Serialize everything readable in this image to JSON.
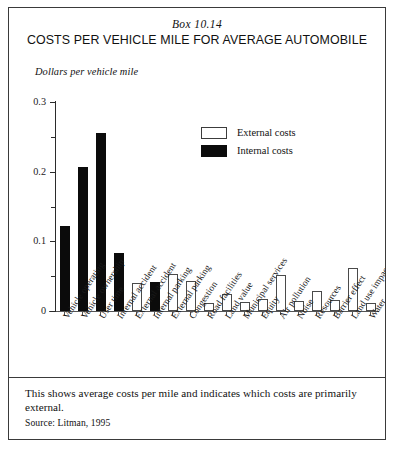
{
  "header": {
    "box_number": "Box 10.14",
    "title": "COSTS PER VEHICLE MILE FOR AVERAGE AUTOMOBILE"
  },
  "legend": {
    "external_label": "External costs",
    "internal_label": "Internal costs",
    "external_color": "#ffffff",
    "internal_color": "#0b0b0b"
  },
  "footer": {
    "note": "This shows average costs per mile and indicates which costs are primarily external.",
    "source": "Source: Litman, 1995"
  },
  "chart_data": {
    "type": "bar",
    "title": "COSTS PER VEHICLE MILE FOR AVERAGE AUTOMOBILE",
    "subtitle": "Box 10.14",
    "xlabel": "",
    "ylabel": "Dollars per vehicle mile",
    "ylim": [
      0,
      0.3
    ],
    "ytick_labels": [
      "0",
      "0.1",
      "0.2",
      "0.3"
    ],
    "ytick_values": [
      0,
      0.1,
      0.2,
      0.3
    ],
    "yminor_values": [
      0.05,
      0.15,
      0.25
    ],
    "grid": false,
    "legend_position": "upper-center-right",
    "categories": [
      "Vehicle operating",
      "Vehicle ownership",
      "User time",
      "Internal accident",
      "External accident",
      "Internal parking",
      "External parking",
      "Congestion",
      "Road facilities",
      "Land value",
      "Municipal services",
      "Equity",
      "Air pollution",
      "Noise",
      "Resources",
      "Barrier effect",
      "Land use impacts",
      "Water"
    ],
    "bars": [
      {
        "label": "Vehicle operating",
        "value": 0.122,
        "cost_type": "Internal costs"
      },
      {
        "label": "Vehicle ownership",
        "value": 0.207,
        "cost_type": "Internal costs"
      },
      {
        "label": "User time",
        "value": 0.255,
        "cost_type": "Internal costs"
      },
      {
        "label": "Internal accident",
        "value": 0.083,
        "cost_type": "Internal costs"
      },
      {
        "label": "External accident",
        "value": 0.04,
        "cost_type": "External costs"
      },
      {
        "label": "Internal parking",
        "value": 0.041,
        "cost_type": "Internal costs"
      },
      {
        "label": "External parking",
        "value": 0.053,
        "cost_type": "External costs"
      },
      {
        "label": "Congestion",
        "value": 0.043,
        "cost_type": "External costs"
      },
      {
        "label": "Road facilities",
        "value": 0.011,
        "cost_type": "External costs"
      },
      {
        "label": "Land value",
        "value": 0.024,
        "cost_type": "External costs"
      },
      {
        "label": "Municipal services",
        "value": 0.013,
        "cost_type": "External costs"
      },
      {
        "label": "Equity",
        "value": 0.017,
        "cost_type": "External costs"
      },
      {
        "label": "Air pollution",
        "value": 0.051,
        "cost_type": "External costs"
      },
      {
        "label": "Noise",
        "value": 0.014,
        "cost_type": "External costs"
      },
      {
        "label": "Resources",
        "value": 0.029,
        "cost_type": "External costs"
      },
      {
        "label": "Barrier effect",
        "value": 0.016,
        "cost_type": "External costs"
      },
      {
        "label": "Land use impacts",
        "value": 0.062,
        "cost_type": "External costs"
      },
      {
        "label": "Water",
        "value": 0.012,
        "cost_type": "External costs"
      }
    ],
    "series": [
      {
        "name": "Internal costs",
        "values": [
          0.122,
          0.207,
          0.255,
          0.083,
          null,
          0.041,
          null,
          null,
          null,
          null,
          null,
          null,
          null,
          null,
          null,
          null,
          null,
          null
        ]
      },
      {
        "name": "External costs",
        "values": [
          null,
          null,
          null,
          null,
          0.04,
          null,
          0.053,
          0.043,
          0.011,
          0.024,
          0.013,
          0.017,
          0.051,
          0.014,
          0.029,
          0.016,
          0.062,
          0.012
        ]
      }
    ]
  }
}
